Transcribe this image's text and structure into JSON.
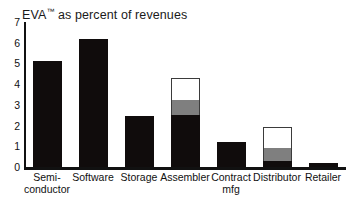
{
  "chart_data": {
    "type": "bar",
    "title": "EVA™ as percent of revenues",
    "title_main": "EVA",
    "title_tm": "™",
    "title_rest": " as percent of revenues",
    "xlabel": "",
    "ylabel": "",
    "ylim": [
      0,
      7
    ],
    "yticks": [
      7,
      6,
      5,
      4,
      3,
      2,
      1,
      0
    ],
    "ytick_labels": [
      "7",
      "6",
      "5",
      "4",
      "3",
      "2",
      "1",
      "0"
    ],
    "grid": false,
    "legend": "none",
    "stacked": true,
    "categories": [
      "Semi-conductor",
      "Software",
      "Storage",
      "Assembler",
      "Contract mfg",
      "Distributor",
      "Retailer"
    ],
    "category_lines": [
      [
        "Semi-",
        "conductor"
      ],
      [
        "Software",
        ""
      ],
      [
        "Storage",
        ""
      ],
      [
        "Assembler",
        ""
      ],
      [
        "Contract",
        "mfg"
      ],
      [
        "Distributor",
        ""
      ],
      [
        "Retailer",
        ""
      ]
    ],
    "series": [
      {
        "name": "black",
        "color": "#100c0c",
        "values": [
          5.1,
          6.2,
          2.45,
          2.5,
          1.2,
          0.3,
          0.2
        ]
      },
      {
        "name": "gray",
        "color": "#7f7f7f",
        "values": [
          0,
          0,
          0,
          0.75,
          0,
          0.6,
          0
        ]
      },
      {
        "name": "white",
        "color": "#ffffff",
        "values": [
          0,
          0,
          0,
          1.05,
          0,
          1.05,
          0
        ]
      }
    ],
    "totals": [
      5.1,
      6.2,
      2.45,
      4.3,
      1.2,
      1.95,
      0.2
    ]
  },
  "colors": {
    "black": "#100c0c",
    "gray": "#7f7f7f",
    "white": "#ffffff",
    "outline": "#3b3b3b",
    "axis": "#111111",
    "background": "#ffffff"
  }
}
